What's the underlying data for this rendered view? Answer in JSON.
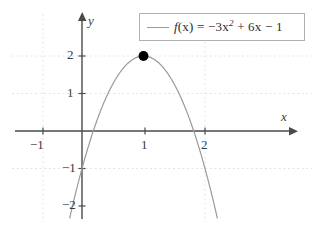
{
  "chart_data": {
    "type": "line",
    "title": "",
    "xlabel": "x",
    "ylabel": "y",
    "expression": "f(x) = -3x^2 + 6x - 1",
    "legend": {
      "position": "top-right",
      "entries": [
        {
          "label_plain": "f(x) = −3x² + 6x − 1",
          "fn_name": "f",
          "fn_arg": "(x)",
          "equals": "=",
          "term_a": "−3x",
          "exponent": "2",
          "term_b": "+ 6x",
          "term_c": "− 1",
          "color": "#9a9a9a"
        }
      ]
    },
    "xlim": [
      -1.1,
      3.3
    ],
    "ylim": [
      -2.3,
      2.5
    ],
    "xticks": [
      -1,
      1,
      2
    ],
    "xtick_labels": [
      "−1",
      "1",
      "2"
    ],
    "yticks": [
      -2,
      -1,
      1,
      2
    ],
    "ytick_labels": [
      "−2",
      "−1",
      "1",
      "2"
    ],
    "grid": "dotted-faint",
    "gridlines_y": [
      1,
      2
    ],
    "gridlines_x": [
      2
    ],
    "series": [
      {
        "name": "f(x) = −3x² + 6x − 1",
        "color": "#9a9a9a",
        "coefficients": {
          "a": -3,
          "b": 6,
          "c": -1
        },
        "x": [
          -0.35,
          -0.2,
          0,
          0.1835,
          0.4,
          0.6,
          0.8,
          1.0,
          1.2,
          1.4,
          1.6,
          1.8165,
          2.0,
          2.2,
          2.4,
          2.55
        ],
        "y": [
          -3.47,
          -2.32,
          -1,
          0,
          1.4,
          1.52,
          1.88,
          2.0,
          1.88,
          1.52,
          0.92,
          0,
          -1.0,
          -2.32,
          -3.88,
          -5.2
        ]
      }
    ],
    "points": [
      {
        "name": "vertex",
        "x": 1,
        "y": 2,
        "marker": "filled-circle",
        "color": "#000000"
      }
    ]
  },
  "axes": {
    "x_axis_label": "x",
    "y_axis_label": "y",
    "x_arrow": "right-arrow",
    "y_arrow": "up-arrow"
  }
}
